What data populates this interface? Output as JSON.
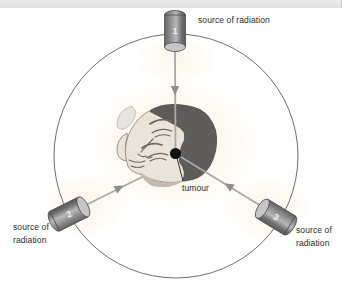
{
  "figure": {
    "tumour_label": "tumour"
  },
  "sources": [
    {
      "number": "1",
      "label": "source of radiation",
      "position": "top"
    },
    {
      "number": "2",
      "label": "source of radiation",
      "position": "bottom-left"
    },
    {
      "number": "3",
      "label": "source of radiation",
      "position": "bottom-right"
    }
  ],
  "colors": {
    "top_bar": "#e4e4e4",
    "circle_stroke": "#6e6e6e",
    "beam_line": "#a8a8a8",
    "arrowhead": "#8f8f8f",
    "cylinder_body": "#8c8c8c",
    "cylinder_face": "#c6c6c8",
    "hair": "#5e5b5b",
    "skin": "#eae3da",
    "tumour_dot": "#111111",
    "label_text": "#2b2b2b",
    "glow": "#f6f0dc"
  }
}
